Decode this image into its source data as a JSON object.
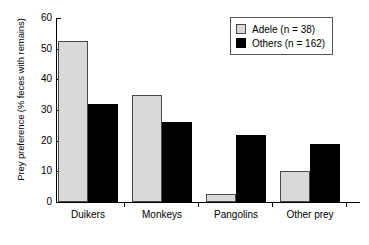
{
  "chart_data": {
    "type": "bar",
    "title": "",
    "xlabel": "",
    "ylabel": "Prey preference (% feces with remains)",
    "categories": [
      "Duikers",
      "Monkeys",
      "Pangolins",
      "Other prey"
    ],
    "series": [
      {
        "name": "Adele (n = 38)",
        "color": "#d9d9d9",
        "values": [
          52.5,
          35,
          2.5,
          10
        ]
      },
      {
        "name": "Others (n = 162)",
        "color": "#000000",
        "values": [
          32,
          26,
          22,
          19
        ]
      }
    ],
    "ylim": [
      0,
      60
    ],
    "yticks": [
      0,
      10,
      20,
      30,
      40,
      50,
      60
    ],
    "ytick_labels": [
      "0",
      "10",
      "20",
      "30",
      "40",
      "50",
      "60"
    ],
    "grid": false,
    "legend_position": "top-right"
  },
  "legend": {
    "entries": [
      {
        "label": "Adele (n = 38)",
        "swatch": "light"
      },
      {
        "label": "Others (n = 162)",
        "swatch": "dark"
      }
    ]
  }
}
